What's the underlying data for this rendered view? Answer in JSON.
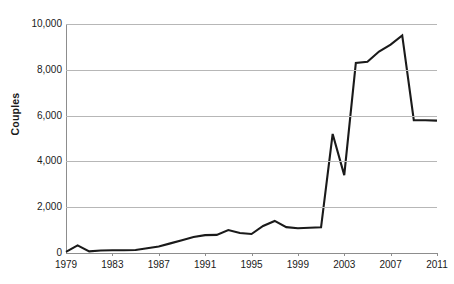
{
  "chart_data": {
    "type": "line",
    "title": "",
    "xlabel": "",
    "ylabel": "Couples",
    "ylim": [
      0,
      10000
    ],
    "xlim": [
      1979,
      2011
    ],
    "grid": true,
    "legend": false,
    "line_color": "#1a1a1a",
    "gridline_color": "#b7b7b7",
    "axis_color": "#8d8d8d",
    "ytick_labels": [
      "10,000",
      "8,000",
      "6,000",
      "4,000",
      "2,000",
      "0"
    ],
    "ytick_values": [
      10000,
      8000,
      6000,
      4000,
      2000,
      0
    ],
    "xtick_labels": [
      "1979",
      "1983",
      "1987",
      "1991",
      "1995",
      "1999",
      "2003",
      "2007",
      "2011"
    ],
    "xtick_values": [
      1979,
      1983,
      1987,
      1991,
      1995,
      1999,
      2003,
      2007,
      2011
    ],
    "x": [
      1979,
      1980,
      1981,
      1982,
      1983,
      1984,
      1985,
      1986,
      1987,
      1988,
      1989,
      1990,
      1991,
      1992,
      1993,
      1994,
      1995,
      1996,
      1997,
      1998,
      1999,
      2000,
      2001,
      2002,
      2003,
      2004,
      2005,
      2006,
      2007,
      2008,
      2009,
      2010,
      2011
    ],
    "values": [
      50,
      330,
      70,
      110,
      120,
      120,
      130,
      210,
      280,
      420,
      560,
      700,
      780,
      790,
      1000,
      870,
      830,
      1180,
      1400,
      1130,
      1080,
      1100,
      1120,
      5200,
      3400,
      8300,
      8350,
      8800,
      9100,
      9500,
      5800,
      5800,
      5780
    ],
    "series": [
      {
        "name": "Couples",
        "values": [
          50,
          330,
          70,
          110,
          120,
          120,
          130,
          210,
          280,
          420,
          560,
          700,
          780,
          790,
          1000,
          870,
          830,
          1180,
          1400,
          1130,
          1080,
          1100,
          1120,
          5200,
          3400,
          8300,
          8350,
          8800,
          9100,
          9500,
          5800,
          5800,
          5780
        ]
      }
    ]
  }
}
